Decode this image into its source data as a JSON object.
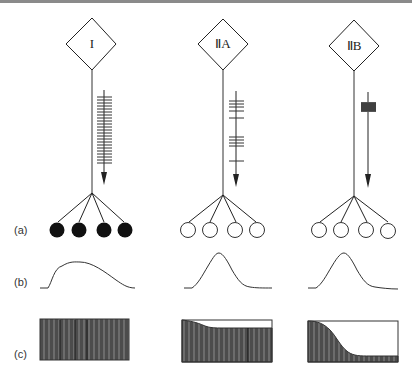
{
  "figure": {
    "type": "motor unit types diagram",
    "row_labels": [
      "(a)",
      "(b)",
      "(c)"
    ],
    "units": [
      {
        "name": "I",
        "fiber_fill": "filled",
        "fiber_count": 4,
        "spike_pattern": "continuous regular low-frequency train",
        "twitch": "slow broad",
        "fatigue": "fatigue-resistant (flat)"
      },
      {
        "name": "ⅡA",
        "fiber_fill": "open",
        "fiber_count": 4,
        "spike_pattern": "bursts",
        "twitch": "fast",
        "fatigue": "slight decline then plateau"
      },
      {
        "name": "ⅡB",
        "fiber_fill": "open",
        "fiber_count": 4,
        "spike_pattern": "single high-frequency burst",
        "twitch": "fast",
        "fatigue": "rapid decline"
      }
    ],
    "colors": {
      "line": "#222222",
      "fill_dark": "#4a4a4a",
      "fiber_filled": "#111111",
      "top_rule": "#8a8a8a"
    }
  }
}
